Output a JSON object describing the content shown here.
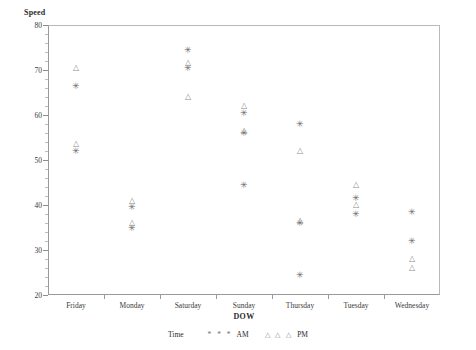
{
  "chart_data": {
    "type": "scatter",
    "title": "",
    "ylabel": "Speed",
    "xlabel": "DOW",
    "ylim": [
      20,
      80
    ],
    "ytick_values": [
      20,
      30,
      40,
      50,
      60,
      70,
      80
    ],
    "ytick_labels": [
      "20",
      "30",
      "40",
      "50",
      "60",
      "70",
      "80"
    ],
    "y_minor_step": 2,
    "grid": false,
    "categories": [
      "Friday",
      "Monday",
      "Saturday",
      "Sunday",
      "Thursday",
      "Tuesday",
      "Wednesday"
    ],
    "legend": {
      "title": "Time",
      "position": "bottom-center",
      "entries": [
        {
          "name": "AM",
          "marker": "asterisk",
          "glyphs": "* * *"
        },
        {
          "name": "PM",
          "marker": "triangle",
          "glyphs": "△ △ △"
        }
      ]
    },
    "series": [
      {
        "name": "AM",
        "marker": "asterisk",
        "points": [
          {
            "x": "Friday",
            "y": 66.5
          },
          {
            "x": "Friday",
            "y": 52.0
          },
          {
            "x": "Monday",
            "y": 39.5
          },
          {
            "x": "Monday",
            "y": 35.0
          },
          {
            "x": "Saturday",
            "y": 74.5
          },
          {
            "x": "Saturday",
            "y": 70.5
          },
          {
            "x": "Sunday",
            "y": 60.5
          },
          {
            "x": "Sunday",
            "y": 56.0
          },
          {
            "x": "Sunday",
            "y": 44.5
          },
          {
            "x": "Thursday",
            "y": 58.0
          },
          {
            "x": "Thursday",
            "y": 36.0
          },
          {
            "x": "Thursday",
            "y": 24.5
          },
          {
            "x": "Tuesday",
            "y": 41.5
          },
          {
            "x": "Tuesday",
            "y": 38.0
          },
          {
            "x": "Wednesday",
            "y": 38.5
          },
          {
            "x": "Wednesday",
            "y": 32.0
          }
        ]
      },
      {
        "name": "PM",
        "marker": "triangle",
        "points": [
          {
            "x": "Friday",
            "y": 70.5
          },
          {
            "x": "Friday",
            "y": 53.5
          },
          {
            "x": "Monday",
            "y": 41.0
          },
          {
            "x": "Monday",
            "y": 36.0
          },
          {
            "x": "Saturday",
            "y": 71.5
          },
          {
            "x": "Saturday",
            "y": 64.0
          },
          {
            "x": "Sunday",
            "y": 62.0
          },
          {
            "x": "Sunday",
            "y": 56.5
          },
          {
            "x": "Thursday",
            "y": 52.0
          },
          {
            "x": "Thursday",
            "y": 36.5
          },
          {
            "x": "Tuesday",
            "y": 44.5
          },
          {
            "x": "Tuesday",
            "y": 40.0
          },
          {
            "x": "Wednesday",
            "y": 28.0
          },
          {
            "x": "Wednesday",
            "y": 26.0
          }
        ]
      }
    ]
  }
}
